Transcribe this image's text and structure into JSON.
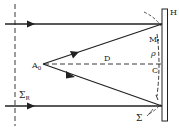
{
  "diagram": {
    "labels": {
      "screen": "H",
      "point_m": "M",
      "rho": "ρ",
      "center": "C",
      "distance": "D",
      "source_main": "A",
      "source_sub": "0",
      "sigma_r_main": "Σ",
      "sigma_r_sub": "R",
      "sigma": "Σ"
    },
    "colors": {
      "ink": "#222222",
      "background": "#ffffff"
    }
  }
}
